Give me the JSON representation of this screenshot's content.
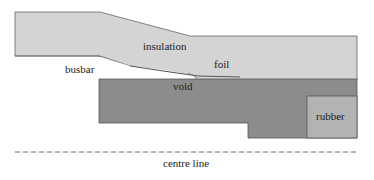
{
  "diagram": {
    "labels": {
      "insulation": "insulation",
      "foil": "foil",
      "busbar": "busbar",
      "void": "void",
      "rubber": "rubber",
      "centre_line": "centre line"
    },
    "colors": {
      "insulation": "#d4d4d4",
      "conductor": "#8c8c8c",
      "rubber": "#b3b3b3",
      "void": "#ffffff",
      "outline": "#555555"
    }
  }
}
